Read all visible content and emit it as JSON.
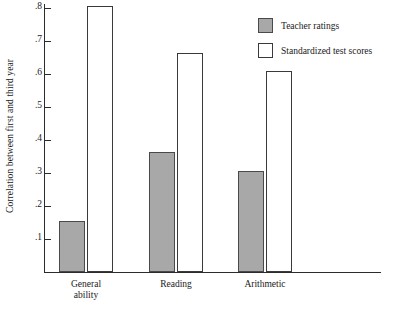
{
  "chart_data": {
    "type": "bar",
    "title": "",
    "xlabel": "",
    "ylabel": "Correlation between first and third year",
    "categories": [
      "General ability",
      "Reading",
      "Arithmetic"
    ],
    "category_lines": [
      [
        "General",
        "ability"
      ],
      [
        "Reading",
        ""
      ],
      [
        "Arithmetic",
        ""
      ]
    ],
    "series": [
      {
        "name": "Teacher ratings",
        "values": [
          0.155,
          0.365,
          0.305
        ],
        "color": "#a8a8a8"
      },
      {
        "name": "Standardized test scores",
        "values": [
          0.805,
          0.665,
          0.61
        ],
        "color": "#ffffff"
      }
    ],
    "ylim": [
      0,
      0.82
    ],
    "yticks": [
      0.1,
      0.2,
      0.3,
      0.4,
      0.5,
      0.6,
      0.7,
      0.8
    ],
    "ytick_labels": [
      ".1",
      ".2",
      ".3",
      ".4",
      ".5",
      ".6",
      ".7",
      ".8"
    ],
    "grid": false,
    "legend_position": "top-right"
  },
  "legend": {
    "items": [
      {
        "label": "Teacher ratings",
        "swatch": "gray-filled-square"
      },
      {
        "label": "Standardized test scores",
        "swatch": "white-empty-square"
      }
    ]
  }
}
